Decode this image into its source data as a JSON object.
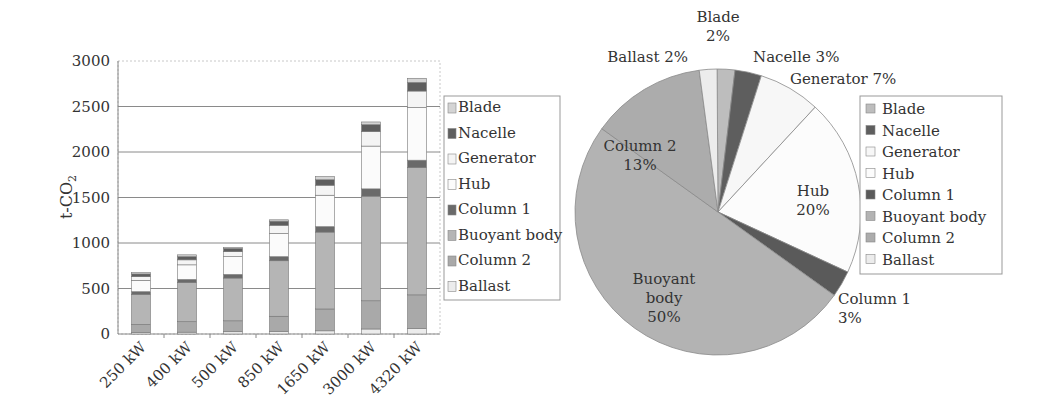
{
  "chart_data": [
    {
      "type": "bar",
      "stacked": true,
      "title": "",
      "xlabel": "",
      "ylabel": "t-CO2",
      "ylim": [
        0,
        3000
      ],
      "yticks": [
        0,
        500,
        1000,
        1500,
        2000,
        2500,
        3000
      ],
      "grid": true,
      "legend_position": "right",
      "categories": [
        "250 kW",
        "400 kW",
        "500 kW",
        "850 kW",
        "1650 kW",
        "3000 kW",
        "4320 kW"
      ],
      "series": [
        {
          "name": "Ballast",
          "color": "#ececec",
          "values": [
            15,
            20,
            25,
            30,
            35,
            55,
            60
          ]
        },
        {
          "name": "Column 2",
          "color": "#a9a9a9",
          "values": [
            90,
            115,
            120,
            165,
            240,
            310,
            370
          ]
        },
        {
          "name": "Buoyant body",
          "color": "#b5b5b5",
          "values": [
            330,
            430,
            470,
            610,
            845,
            1150,
            1400
          ]
        },
        {
          "name": "Column 1",
          "color": "#6a6a6a",
          "values": [
            30,
            35,
            40,
            45,
            60,
            80,
            80
          ]
        },
        {
          "name": "Hub",
          "color": "#fbfbfb",
          "values": [
            125,
            160,
            195,
            255,
            345,
            470,
            580
          ]
        },
        {
          "name": "Generator",
          "color": "#f4f4f4",
          "values": [
            40,
            55,
            55,
            90,
            110,
            160,
            180
          ]
        },
        {
          "name": "Nacelle",
          "color": "#5e5e5e",
          "values": [
            30,
            35,
            35,
            45,
            60,
            75,
            95
          ]
        },
        {
          "name": "Blade",
          "color": "#d4d4d4",
          "values": [
            15,
            20,
            10,
            15,
            35,
            30,
            45
          ]
        }
      ],
      "legend": [
        "Blade",
        "Nacelle",
        "Generator",
        "Hub",
        "Column 1",
        "Buoyant body",
        "Column 2",
        "Ballast"
      ]
    },
    {
      "type": "pie",
      "title": "",
      "legend_position": "right",
      "slices": [
        {
          "label": "Blade",
          "value": 2,
          "display": "2%",
          "color": "#bdbdbd"
        },
        {
          "label": "Nacelle",
          "value": 3,
          "display": "3%",
          "color": "#5e5e5e"
        },
        {
          "label": "Generator",
          "value": 7,
          "display": "7%",
          "color": "#f7f7f7"
        },
        {
          "label": "Hub",
          "value": 20,
          "display": "20%",
          "color": "#fcfcfc"
        },
        {
          "label": "Column 1",
          "value": 3,
          "display": "3%",
          "color": "#5a5a5a"
        },
        {
          "label": "Buoyant body",
          "value": 50,
          "display": "50%",
          "color": "#b3b3b3"
        },
        {
          "label": "Column 2",
          "value": 13,
          "display": "13%",
          "color": "#acacac"
        },
        {
          "label": "Ballast",
          "value": 2,
          "display": "2%",
          "color": "#ececec"
        }
      ],
      "legend": [
        "Blade",
        "Nacelle",
        "Generator",
        "Hub",
        "Column 1",
        "Buoyant body",
        "Column 2",
        "Ballast"
      ]
    }
  ]
}
